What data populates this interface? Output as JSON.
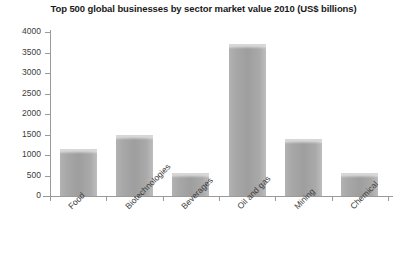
{
  "chart_data": {
    "type": "bar",
    "title": "Top 500 global businesses by sector market value 2010 (US$ billions)",
    "xlabel": "",
    "ylabel": "",
    "categories": [
      "Food",
      "Biotechnologies",
      "Beverages",
      "Oil and gas",
      "Mining",
      "Chemical"
    ],
    "values": [
      1150,
      1500,
      570,
      3700,
      1400,
      550
    ],
    "ylim": [
      0,
      4000
    ],
    "yticks": [
      0,
      500,
      1000,
      1500,
      2000,
      2500,
      3000,
      3500,
      4000
    ],
    "ytick_labels": [
      "0",
      "500",
      "1000",
      "1500",
      "2000",
      "2500",
      "3000",
      "3500",
      "4000"
    ],
    "grid": false,
    "legend": false,
    "bar_color": "#a3a3a3",
    "axis_color": "#9a9a9a",
    "title_color": "#1a1a1a",
    "background": "#ffffff"
  }
}
